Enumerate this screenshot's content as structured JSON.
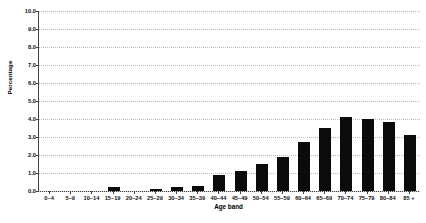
{
  "chart_data": {
    "type": "bar",
    "title": "",
    "xlabel": "Age band",
    "ylabel": "Percentage",
    "categories": [
      "0–4",
      "5–9",
      "10–14",
      "15–19",
      "20–24",
      "25–29",
      "30–34",
      "35–39",
      "40–44",
      "45–49",
      "50–54",
      "55–59",
      "60–64",
      "65–69",
      "70–74",
      "75–79",
      "80–84",
      "85 +"
    ],
    "values": [
      0.0,
      0.0,
      0.0,
      0.25,
      0.0,
      0.1,
      0.25,
      0.3,
      0.9,
      1.1,
      1.5,
      1.9,
      2.7,
      3.5,
      4.1,
      4.0,
      3.85,
      3.1
    ],
    "ylim": [
      0.0,
      10.0
    ],
    "ytick_labels": [
      "0.0",
      "1.0",
      "2.0",
      "3.0",
      "4.0",
      "5.0",
      "6.0",
      "7.0",
      "8.0",
      "9.0",
      "10.0"
    ],
    "ytick_values": [
      0.0,
      1.0,
      2.0,
      3.0,
      4.0,
      5.0,
      6.0,
      7.0,
      8.0,
      9.0,
      10.0
    ],
    "grid": true,
    "grid_axis": "y",
    "legend": false,
    "bar_color": "#0b0b0b",
    "series_name": "Percentage"
  },
  "caption": {
    "cut_text": ""
  }
}
